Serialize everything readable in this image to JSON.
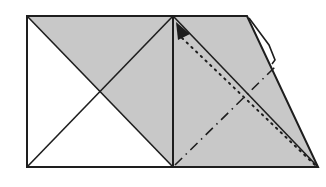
{
  "diagram": {
    "type": "origami-fold-step",
    "colors": {
      "paper_shaded": "#c8c8c8",
      "paper_white": "#ffffff",
      "line": "#1e1e1e",
      "background": "#ffffff"
    },
    "elements": [
      {
        "name": "left-square",
        "desc": "square with both diagonals"
      },
      {
        "name": "shaded-triangle",
        "desc": "upper-right half of left square shaded"
      },
      {
        "name": "right-trapezoid",
        "desc": "shaded flap with slanted right edge"
      },
      {
        "name": "solid-diagonal",
        "desc": "crease from top center to bottom-right corner"
      },
      {
        "name": "valley-fold-line",
        "desc": "dotted line with arrow head at top"
      },
      {
        "name": "mountain-fold-line",
        "desc": "dash-dot line from bottom center toward upper right"
      },
      {
        "name": "edge-flap",
        "desc": "thin layered edge along upper slanted side"
      }
    ]
  }
}
